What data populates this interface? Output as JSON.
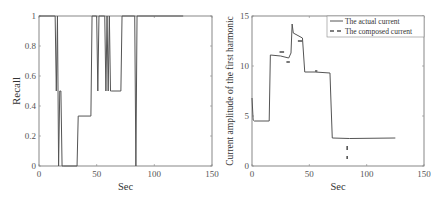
{
  "chart_data": [
    {
      "type": "line",
      "title": "",
      "xlabel": "Sec",
      "ylabel": "Recall",
      "xlim": [
        0,
        150
      ],
      "ylim": [
        0,
        1
      ],
      "xticks": [
        "0",
        "50",
        "100",
        "150"
      ],
      "yticks": [
        "0",
        "0.2",
        "0.4",
        "0.6",
        "0.8",
        "1"
      ],
      "grid": false,
      "legend": null,
      "series": [
        {
          "name": "Recall",
          "color": "#555555",
          "x": [
            0,
            14,
            15,
            16,
            17,
            18,
            19,
            20,
            21,
            33,
            34,
            45,
            46,
            50,
            51,
            52,
            53,
            57,
            58,
            59,
            60,
            61,
            62,
            63,
            71,
            72,
            83,
            84,
            85,
            86,
            125
          ],
          "y": [
            1,
            1,
            0.5,
            1,
            0,
            0.5,
            0.5,
            0,
            0,
            0,
            0.333,
            0.333,
            1,
            1,
            0.5,
            1,
            1,
            1,
            0.5,
            1,
            0.5,
            1,
            0.5,
            0.5,
            0.5,
            1,
            1,
            0,
            1,
            1,
            1
          ]
        }
      ]
    },
    {
      "type": "line",
      "title": "",
      "xlabel": "Sec",
      "ylabel": "Current amplitude of the first harmonic",
      "xlim": [
        0,
        150
      ],
      "ylim": [
        0,
        15
      ],
      "xticks": [
        "0",
        "50",
        "100",
        "150"
      ],
      "yticks": [
        "0",
        "5",
        "10",
        "15"
      ],
      "grid": false,
      "legend": {
        "position": "upper right",
        "entries": [
          "The actual current",
          "The composed current"
        ]
      },
      "series": [
        {
          "name": "The actual current",
          "style": "solid",
          "color": "#555555",
          "x": [
            0,
            1,
            2,
            15,
            16,
            25,
            32,
            34,
            35,
            36,
            44,
            46,
            55,
            68,
            69,
            70,
            85,
            125
          ],
          "y": [
            6.8,
            4.6,
            4.5,
            4.5,
            11.1,
            11.0,
            10.8,
            11.3,
            14.2,
            13.3,
            12.8,
            9.4,
            9.4,
            9.3,
            6.0,
            2.8,
            2.75,
            2.8
          ]
        },
        {
          "name": "The composed current",
          "style": "dashed",
          "color": "#555555",
          "segments": [
            {
              "x": [
                24,
                28
              ],
              "y": [
                11.4,
                11.4
              ]
            },
            {
              "x": [
                30,
                33
              ],
              "y": [
                10.4,
                10.4
              ]
            },
            {
              "x": [
                40,
                44
              ],
              "y": [
                12.5,
                12.5
              ]
            },
            {
              "x": [
                55,
                57
              ],
              "y": [
                9.5,
                9.5
              ]
            },
            {
              "x": [
                83,
                83
              ],
              "y": [
                2.0,
                1.6
              ]
            },
            {
              "x": [
                83,
                83
              ],
              "y": [
                1.0,
                0.7
              ]
            }
          ]
        }
      ]
    }
  ]
}
